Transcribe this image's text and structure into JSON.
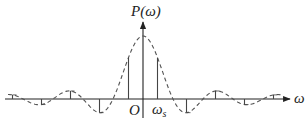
{
  "diagram": {
    "y_axis_label": "P(ω)",
    "x_axis_label": "ω",
    "origin_label": "O",
    "sample_label": {
      "main": "ω",
      "sub": "s"
    },
    "colors": {
      "axis": "#222222",
      "curve": "#555555",
      "samples": "#444444",
      "background": "#ffffff"
    }
  }
}
